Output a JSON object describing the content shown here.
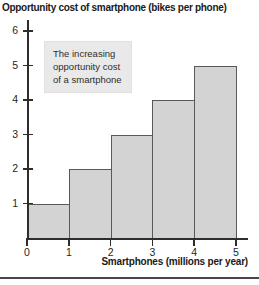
{
  "figure": {
    "title": "Opportunity cost of smartphone (bikes per phone)",
    "xlabel": "Smartphones (millions per year)",
    "annotation_lines": {
      "0": "The increasing",
      "1": "opportunity cost",
      "2": "of a smartphone"
    }
  },
  "chart_data": {
    "type": "bar",
    "title": "Opportunity cost of smartphone (bikes per phone)",
    "xlabel": "Smartphones (millions per year)",
    "ylabel": "Opportunity cost (bikes per phone)",
    "categories": [
      "0-1",
      "1-2",
      "2-3",
      "3-4",
      "4-5"
    ],
    "values": [
      1,
      2,
      3,
      4,
      5
    ],
    "x_ticks": [
      0,
      1,
      2,
      3,
      4,
      5
    ],
    "y_ticks": [
      1,
      2,
      3,
      4,
      5,
      6
    ],
    "xlim": [
      0,
      5
    ],
    "ylim": [
      0,
      6
    ],
    "grid": false,
    "legend": "none",
    "annotation": "The increasing opportunity cost of a smartphone",
    "bar_fill": "#d3d3d3",
    "bar_border": "#59595b",
    "axis_color": "#2f2d2b",
    "annotation_bg": "#e9e9e9"
  }
}
